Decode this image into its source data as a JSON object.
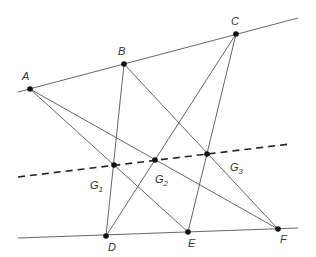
{
  "diagram": {
    "colors": {
      "line": "#555555",
      "point": "#111111",
      "label": "#333333"
    },
    "points": [
      {
        "id": "A",
        "label": "A",
        "x": 30,
        "y": 89,
        "lx": 22,
        "ly": 80
      },
      {
        "id": "B",
        "label": "B",
        "x": 124,
        "y": 64,
        "lx": 118,
        "ly": 55
      },
      {
        "id": "C",
        "label": "C",
        "x": 236,
        "y": 34,
        "lx": 231,
        "ly": 25
      },
      {
        "id": "D",
        "label": "D",
        "x": 106,
        "y": 236,
        "lx": 108,
        "ly": 251
      },
      {
        "id": "E",
        "label": "E",
        "x": 188,
        "y": 232,
        "lx": 188,
        "ly": 247
      },
      {
        "id": "F",
        "label": "F",
        "x": 278,
        "y": 229,
        "lx": 280,
        "ly": 243
      },
      {
        "id": "G1",
        "label": "G",
        "sub": "1",
        "x": 114,
        "y": 165,
        "lx": 90,
        "ly": 189
      },
      {
        "id": "G2",
        "label": "G",
        "sub": "2",
        "x": 155,
        "y": 160,
        "lx": 155,
        "ly": 183
      },
      {
        "id": "G3",
        "label": "G",
        "sub": "3",
        "x": 207,
        "y": 154,
        "lx": 230,
        "ly": 171
      }
    ],
    "lines": [
      {
        "name": "top-line",
        "x1": 18,
        "y1": 92,
        "x2": 298,
        "y2": 18,
        "dashed": false
      },
      {
        "name": "bottom-line",
        "x1": 18,
        "y1": 238,
        "x2": 298,
        "y2": 228,
        "dashed": false
      },
      {
        "name": "pappus-line",
        "x1": 18,
        "y1": 177,
        "x2": 290,
        "y2": 144,
        "dashed": true
      },
      {
        "name": "line-AE",
        "x1": 30,
        "y1": 89,
        "x2": 188,
        "y2": 232,
        "dashed": false
      },
      {
        "name": "line-AF",
        "x1": 30,
        "y1": 89,
        "x2": 278,
        "y2": 229,
        "dashed": false
      },
      {
        "name": "line-BD",
        "x1": 124,
        "y1": 64,
        "x2": 106,
        "y2": 236,
        "dashed": false
      },
      {
        "name": "line-BF",
        "x1": 124,
        "y1": 64,
        "x2": 278,
        "y2": 229,
        "dashed": false
      },
      {
        "name": "line-CD",
        "x1": 236,
        "y1": 34,
        "x2": 106,
        "y2": 236,
        "dashed": false
      },
      {
        "name": "line-CE",
        "x1": 236,
        "y1": 34,
        "x2": 188,
        "y2": 232,
        "dashed": false
      }
    ]
  }
}
